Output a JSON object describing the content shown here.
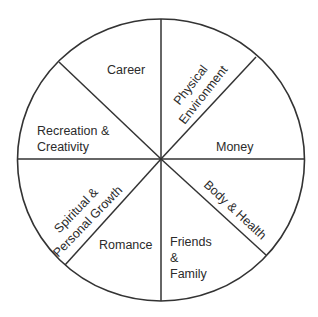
{
  "diagram": {
    "type": "wheel-of-life",
    "segments": [
      {
        "id": "career",
        "label": "Career"
      },
      {
        "id": "physical-environment",
        "label_lines": [
          "Physical",
          "Environment"
        ]
      },
      {
        "id": "money",
        "label": "Money"
      },
      {
        "id": "body-health",
        "label": "Body & Health"
      },
      {
        "id": "friends-family",
        "label_lines": [
          "Friends",
          "&",
          "Family"
        ]
      },
      {
        "id": "romance",
        "label": "Romance"
      },
      {
        "id": "spiritual-growth",
        "label_lines": [
          "Spiritual &",
          "Personal Growth"
        ]
      },
      {
        "id": "recreation-creativity",
        "label_lines": [
          "Recreation &",
          "Creativity"
        ]
      }
    ],
    "colors": {
      "stroke": "#333333",
      "fill": "#ffffff",
      "text": "#2b2b2b"
    }
  }
}
